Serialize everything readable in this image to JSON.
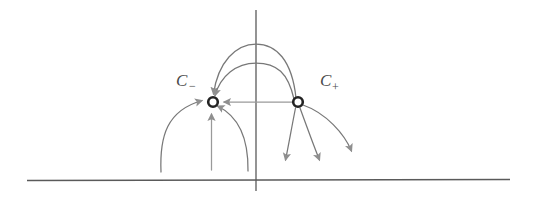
{
  "figure": {
    "type": "phase-portrait-diagram",
    "background_color": "#ffffff",
    "stroke_color": "#6e6e6e",
    "axis_color": "#555555",
    "node_color": "#2b2b2b",
    "arrow_color": "#8a8a8a",
    "width": 535,
    "height": 207
  },
  "axes": {
    "vertical": {
      "name": "vertical-axis",
      "x": 256,
      "y_top": 10,
      "y_bottom": 190
    },
    "horizontal": {
      "name": "horizontal-axis",
      "y": 180,
      "x_left": 27,
      "x_right": 510
    }
  },
  "nodes": [
    {
      "id": "c-minus",
      "label": "C",
      "subscript": "−",
      "label_full": "C−",
      "cx": 213,
      "cy": 102,
      "r": 5.2,
      "label_x": 176,
      "label_y": 84,
      "sub_x": 190,
      "sub_y": 88,
      "role": "stable-node-sink"
    },
    {
      "id": "c-plus",
      "label": "C",
      "subscript": "+",
      "label_full": "C+",
      "cx": 298,
      "cy": 102,
      "r": 5.2,
      "label_x": 320,
      "label_y": 84,
      "sub_x": 333,
      "sub_y": 89,
      "role": "saddle-source"
    }
  ],
  "trajectories": [
    {
      "name": "outer-arc-cplus-to-cminus",
      "path": "M 296 98 C 292 60 276 44 256 44 C 236 44 218 62 213 95",
      "arrow_at": "c-minus",
      "direction": "into-c-minus"
    },
    {
      "name": "inner-arc-cplus-to-cminus",
      "path": "M 294 99 C 288 72 276 62 256 62 C 236 62 220 76 214 96",
      "arrow_at": "c-minus",
      "direction": "into-c-minus"
    },
    {
      "name": "straight-heteroclinic-cplus-to-cminus",
      "path": "M 293 102 L 222 102",
      "arrow_at": "c-minus",
      "direction": "into-c-minus"
    },
    {
      "name": "left-outer-incoming-curve",
      "path": "M 161 172 C 160 134 168 110 204 101",
      "arrow_at": "c-minus",
      "direction": "into-c-minus"
    },
    {
      "name": "left-vertical-incoming-arrow",
      "path": "M 211 170 L 211 113",
      "arrow_at": "c-minus",
      "direction": "into-c-minus"
    },
    {
      "name": "left-right-incoming-curve",
      "path": "M 248 171 C 248 140 240 116 218 106",
      "arrow_at": "c-minus",
      "direction": "into-c-minus"
    },
    {
      "name": "right-outgoing-curve-1",
      "path": "M 296 108 C 292 132 288 150 285 163",
      "arrow_at": "end",
      "direction": "away-from-c-plus"
    },
    {
      "name": "right-outgoing-curve-2",
      "path": "M 300 108 C 308 130 315 150 320 163",
      "arrow_at": "end",
      "direction": "away-from-c-plus"
    },
    {
      "name": "right-outgoing-curve-3",
      "path": "M 303 105 C 325 112 344 134 352 154",
      "arrow_at": "end",
      "direction": "away-from-c-plus"
    }
  ]
}
